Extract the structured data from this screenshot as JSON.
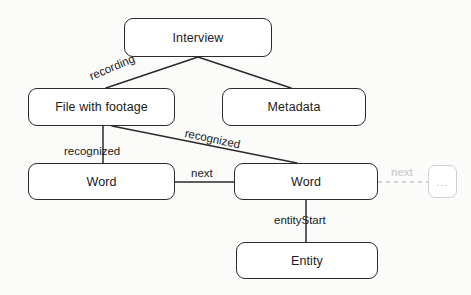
{
  "diagram": {
    "colors": {
      "node_stroke": "#2b2b2b",
      "node_fill": "#ffffff",
      "edge_stroke": "#2b2b2b",
      "ghost_stroke": "#cfcfcf",
      "ghost_text": "#c2c2c2",
      "background": "#fbfbfa"
    },
    "nodes": [
      {
        "id": "interview",
        "label": "Interview",
        "x": 124,
        "y": 18,
        "w": 148,
        "h": 39,
        "ghost": false
      },
      {
        "id": "file",
        "label": "File with footage",
        "x": 28,
        "y": 88,
        "w": 147,
        "h": 38,
        "ghost": false
      },
      {
        "id": "metadata",
        "label": "Metadata",
        "x": 222,
        "y": 88,
        "w": 144,
        "h": 38,
        "ghost": false
      },
      {
        "id": "word-left",
        "label": "Word",
        "x": 28,
        "y": 163,
        "w": 147,
        "h": 37,
        "ghost": false
      },
      {
        "id": "word-right",
        "label": "Word",
        "x": 234,
        "y": 163,
        "w": 144,
        "h": 37,
        "ghost": false
      },
      {
        "id": "entity",
        "label": "Entity",
        "x": 236,
        "y": 242,
        "w": 142,
        "h": 37,
        "ghost": false
      },
      {
        "id": "more",
        "label": "...",
        "x": 428,
        "y": 165,
        "w": 29,
        "h": 33,
        "ghost": true
      }
    ],
    "edges": [
      {
        "id": "interview-file",
        "label": "recording",
        "from": "interview",
        "to": "file",
        "x1": 198,
        "y1": 57,
        "x2": 106,
        "y2": 88,
        "style": "solid"
      },
      {
        "id": "interview-metadata",
        "label": "",
        "from": "interview",
        "to": "metadata",
        "x1": 198,
        "y1": 57,
        "x2": 291,
        "y2": 88,
        "style": "solid"
      },
      {
        "id": "file-word-left",
        "label": "recognized",
        "from": "file",
        "to": "word-left",
        "x1": 103,
        "y1": 126,
        "x2": 103,
        "y2": 163,
        "style": "solid"
      },
      {
        "id": "file-word-right",
        "label": "recognized",
        "from": "file",
        "to": "word-right",
        "x1": 112,
        "y1": 126,
        "x2": 297,
        "y2": 163,
        "style": "solid"
      },
      {
        "id": "word-left-word-right",
        "label": "next",
        "from": "word-left",
        "to": "word-right",
        "x1": 175,
        "y1": 182,
        "x2": 234,
        "y2": 182,
        "style": "solid"
      },
      {
        "id": "word-right-entity",
        "label": "entityStart",
        "from": "word-right",
        "to": "entity",
        "x1": 306,
        "y1": 200,
        "x2": 306,
        "y2": 242,
        "style": "solid"
      },
      {
        "id": "word-right-more",
        "label": "next",
        "from": "word-right",
        "to": "more",
        "x1": 378,
        "y1": 182,
        "x2": 428,
        "y2": 182,
        "style": "dashed"
      }
    ],
    "edge_labels": [
      {
        "id": "label-recording",
        "text": "recording",
        "x": 88,
        "y": 72,
        "rotate": -23,
        "ghost": false
      },
      {
        "id": "label-recognized-1",
        "text": "recognized",
        "x": 64,
        "y": 146,
        "rotate": 0,
        "ghost": false
      },
      {
        "id": "label-recognized-2",
        "text": "recognized",
        "x": 186,
        "y": 128,
        "rotate": 12,
        "ghost": false
      },
      {
        "id": "label-next-1",
        "text": "next",
        "x": 191,
        "y": 168,
        "rotate": 0,
        "ghost": false
      },
      {
        "id": "label-entity-start",
        "text": "entityStart",
        "x": 274,
        "y": 215,
        "rotate": 0,
        "ghost": false
      },
      {
        "id": "label-next-2",
        "text": "next",
        "x": 391,
        "y": 167,
        "rotate": 0,
        "ghost": true
      }
    ]
  }
}
